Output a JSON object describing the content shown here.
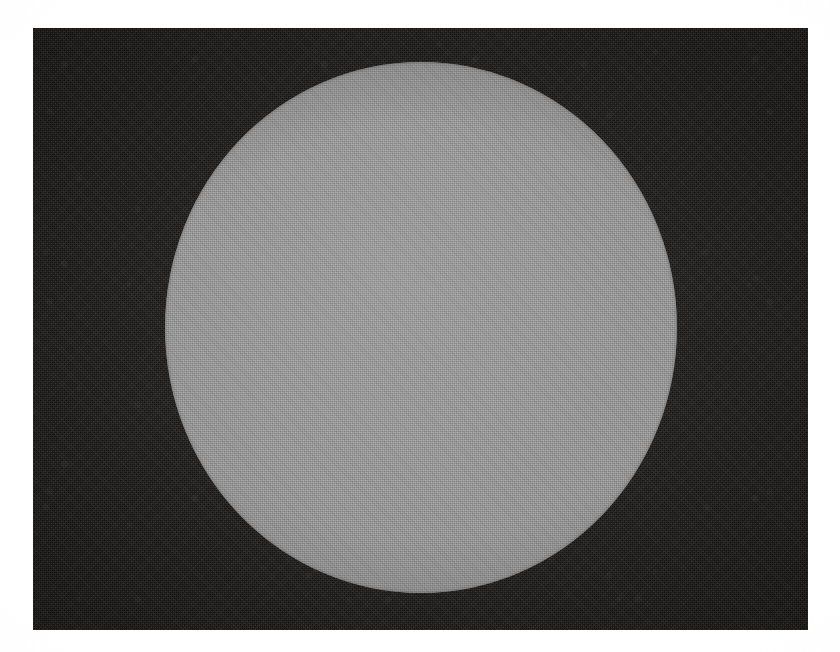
{
  "figure": {
    "kind": "scanned-plate-photograph",
    "caption": "",
    "canvas": {
      "width_px": 840,
      "height_px": 652,
      "background_color": "#ffffff"
    },
    "plate_field": {
      "name": "dark-exposure-field",
      "x_px": 33,
      "y_px": 28,
      "width_px": 775,
      "height_px": 602,
      "fill_color": "#1b1917",
      "texture": "film-grain",
      "label": ""
    },
    "disc": {
      "name": "bright-disc",
      "shape": "ellipse",
      "center_x_px": 421,
      "center_y_px": 327,
      "radius_x_px": 256,
      "radius_y_px": 265,
      "diameter_x_px": 512,
      "diameter_y_px": 531,
      "fill_color": "#9a9a9a",
      "texture": "halftone-screen",
      "label": ""
    },
    "annotations": [],
    "visible_text": []
  }
}
